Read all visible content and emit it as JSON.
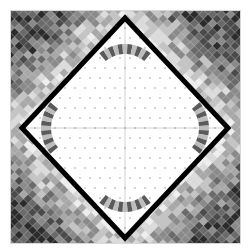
{
  "canvas": {
    "width": 249,
    "height": 252,
    "background": "#ffffff"
  },
  "frame": {
    "x": 10,
    "y": 10,
    "width": 231,
    "height": 234,
    "border_color": "#d8d8d8"
  },
  "tiles": {
    "cell": 9,
    "palette": [
      "#2b2b2b",
      "#4a4a4a",
      "#6a6a6a",
      "#8a8a8a",
      "#a8a8a8",
      "#c4c4c4",
      "#dcdcdc",
      "#eeeeee"
    ],
    "seed": 7
  },
  "diamond": {
    "center": [
      125,
      128
    ],
    "half_width": 103,
    "half_height": 110,
    "border_color": "#000000",
    "border_width": 5,
    "fill": "#ffffff",
    "dot_color": "#888888",
    "dot_spacing": 10,
    "axis_color": "#d0d0d0"
  },
  "arcs": [
    {
      "name": "top",
      "cx": 125,
      "cy": 84,
      "start": 230,
      "end": 310
    },
    {
      "name": "right",
      "cx": 169,
      "cy": 128,
      "start": -40,
      "end": 40
    },
    {
      "name": "bottom",
      "cx": 125,
      "cy": 172,
      "start": 50,
      "end": 130
    },
    {
      "name": "left",
      "cx": 81,
      "cy": 128,
      "start": 140,
      "end": 220
    }
  ],
  "arc_style": {
    "inner_radius": 30,
    "outer_radius": 40,
    "segments": 11,
    "colors": [
      "#5a5a5a",
      "#bdbdbd"
    ]
  }
}
